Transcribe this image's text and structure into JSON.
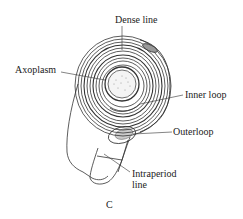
{
  "diagram": {
    "panel_label": "C",
    "labels": {
      "dense_line": "Dense line",
      "axoplasm": "Axoplasm",
      "inner_loop": "Inner loop",
      "outer_loop": "Outerloop",
      "intraperiod_line_1": "Intraperiod",
      "intraperiod_line_2": "line"
    },
    "colors": {
      "ink": "#333333",
      "background": "#ffffff",
      "stipple": "#bbbbbb"
    }
  }
}
